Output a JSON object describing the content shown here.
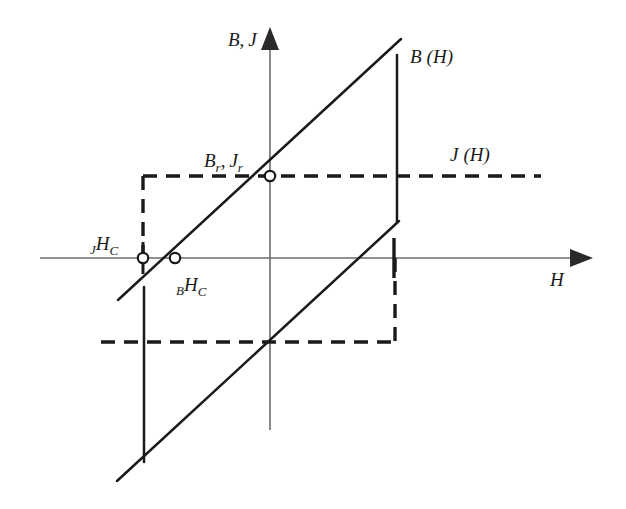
{
  "figure": {
    "type": "hysteresis-loop-diagram",
    "background_color": "#ffffff",
    "ink_color": "#1a1a1a",
    "axis_color": "#555555"
  },
  "axes": {
    "vertical": {
      "name": "vertical-axis",
      "label": "B, J",
      "label_main_1": "B",
      "label_sep": ",",
      "label_main_2": "J",
      "label_x": 232,
      "label_y": 40,
      "x": 270,
      "y_top": 30,
      "y_bottom": 430
    },
    "horizontal": {
      "name": "horizontal-axis",
      "label": "H",
      "label_x": 552,
      "label_y": 283,
      "y": 258,
      "x_left": 40,
      "x_right": 592
    }
  },
  "curves": {
    "b_of_h": {
      "label": "B (H)",
      "label_letter": "B",
      "label_arg": "(H)",
      "label_x": 412,
      "label_y": 62,
      "style": "solid",
      "stroke_width": 2.4,
      "color": "#1a1a1a"
    },
    "j_of_h": {
      "label": "J (H)",
      "label_letter": "J",
      "label_arg": "(H)",
      "label_x": 452,
      "label_y": 160,
      "style": "dashed",
      "dash_pattern": "14,9",
      "stroke_width": 3.4,
      "color": "#1a1a1a"
    }
  },
  "markers": {
    "remanence": {
      "name": "remanence-point",
      "label_main_1": "B",
      "label_sub_1": "r",
      "label_comma": ",",
      "label_main_2": "J",
      "label_sub_2": "r",
      "label_text": "Br, Jr",
      "label_x": 206,
      "label_y": 162,
      "cx": 270,
      "cy": 176,
      "r": 5
    },
    "j_coercivity": {
      "name": "intrinsic-coercivity-point",
      "label_presub": "J",
      "label_main": "H",
      "label_sub": "C",
      "label_text": "JHC",
      "label_x": 92,
      "label_y": 248,
      "cx": 143,
      "cy": 258,
      "r": 5
    },
    "b_coercivity": {
      "name": "normal-coercivity-point",
      "label_presub": "B",
      "label_main": "H",
      "label_sub": "C",
      "label_text": "BHC",
      "label_x": 178,
      "label_y": 289,
      "cx": 175,
      "cy": 258,
      "r": 5
    }
  },
  "geometry": {
    "upper_diagonal": {
      "x1": 118,
      "y1": 300,
      "x2": 401,
      "y2": 39
    },
    "lower_diagonal": {
      "x1": 117,
      "y1": 481,
      "x2": 399,
      "y2": 221
    },
    "b_right_vertical": {
      "x": 397,
      "y1": 55,
      "y2": 222
    },
    "b_left_vertical": {
      "x": 143,
      "y1": 287,
      "y2": 462
    },
    "j_upper_horizontal": {
      "x1": 143,
      "y1": 176,
      "x2": 541,
      "y2": 176
    },
    "j_lower_horizontal": {
      "x1": 101,
      "y1": 342,
      "x2": 396,
      "y2": 342
    },
    "j_left_vertical": {
      "x": 143,
      "y1": 176,
      "y2": 342
    },
    "j_right_vertical": {
      "x": 395,
      "y1": 176,
      "y2": 342
    },
    "j_axis_tick": {
      "x": 394,
      "y1": 238,
      "y2": 278
    }
  }
}
